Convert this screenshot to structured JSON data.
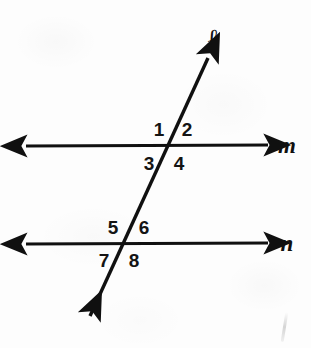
{
  "figure": {
    "background_color": "#fdfdfd",
    "stroke_color": "#101010",
    "width": 311,
    "height": 348
  },
  "lines": [
    {
      "id": "m",
      "label": "m",
      "kind": "parallel-line",
      "orientation": "horizontal",
      "label_x": 287,
      "label_y": 145,
      "x1": 26,
      "y1": 146,
      "x2": 268,
      "y2": 145,
      "arrows": "both"
    },
    {
      "id": "n",
      "label": "n",
      "kind": "parallel-line",
      "orientation": "horizontal",
      "label_x": 287,
      "label_y": 243,
      "x1": 26,
      "y1": 244,
      "x2": 268,
      "y2": 243,
      "arrows": "both"
    },
    {
      "id": "l",
      "label": "ℓ",
      "kind": "transversal",
      "orientation": "diagonal",
      "label_x": 213,
      "label_y": 38,
      "x1": 208,
      "y1": 58,
      "x2": 90,
      "y2": 316,
      "arrows": "both"
    }
  ],
  "intersections": [
    {
      "id": "m-l",
      "x": 172,
      "y": 146,
      "line": "m"
    },
    {
      "id": "n-l",
      "x": 126,
      "y": 244,
      "line": "n"
    }
  ],
  "angles": [
    {
      "id": "angle-1",
      "label": "1",
      "x": 159,
      "y": 129,
      "position": "upper-left",
      "intersection": "m-l"
    },
    {
      "id": "angle-2",
      "label": "2",
      "x": 187,
      "y": 129,
      "position": "upper-right",
      "intersection": "m-l"
    },
    {
      "id": "angle-3",
      "label": "3",
      "x": 149,
      "y": 163,
      "position": "lower-left",
      "intersection": "m-l"
    },
    {
      "id": "angle-4",
      "label": "4",
      "x": 179,
      "y": 163,
      "position": "lower-right",
      "intersection": "m-l"
    },
    {
      "id": "angle-5",
      "label": "5",
      "x": 113,
      "y": 227,
      "position": "upper-left",
      "intersection": "n-l"
    },
    {
      "id": "angle-6",
      "label": "6",
      "x": 144,
      "y": 227,
      "position": "upper-right",
      "intersection": "n-l"
    },
    {
      "id": "angle-7",
      "label": "7",
      "x": 104,
      "y": 260,
      "position": "lower-left",
      "intersection": "n-l"
    },
    {
      "id": "angle-8",
      "label": "8",
      "x": 134,
      "y": 260,
      "position": "lower-right",
      "intersection": "n-l"
    }
  ]
}
